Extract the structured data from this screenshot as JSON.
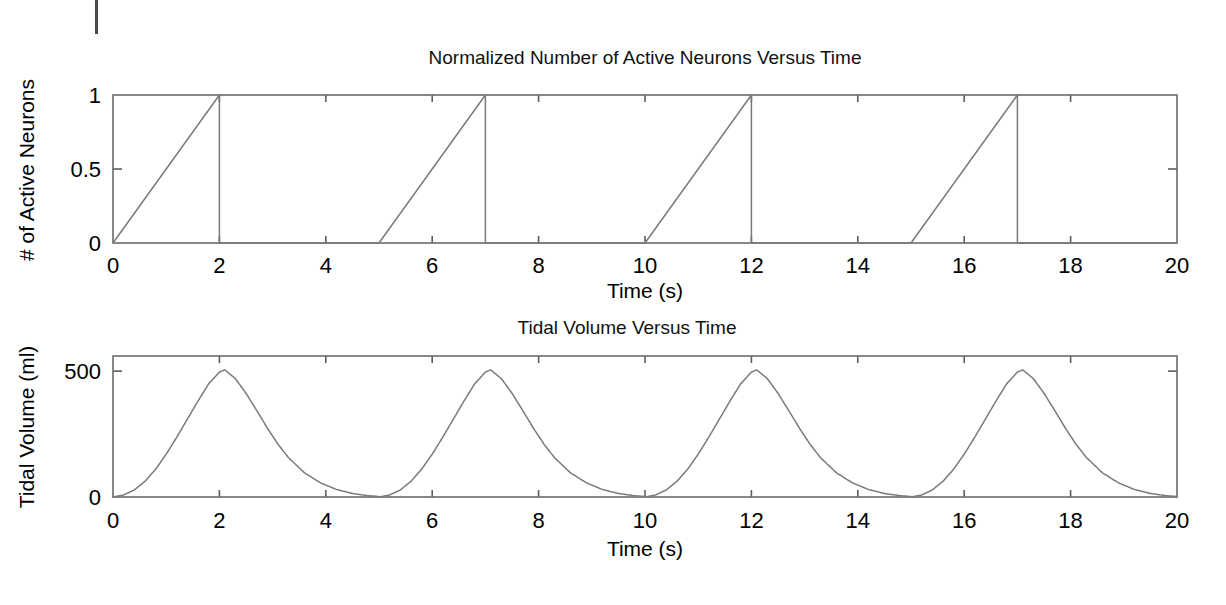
{
  "figure": {
    "background_color": "#ffffff",
    "line_color": "#7a7a7a",
    "axis_color": "#6b6b6b",
    "text_color": "#000000",
    "width": 1226,
    "height": 605
  },
  "artifact": {
    "name": "scan-edge-mark",
    "x": 95,
    "y": 0,
    "width": 3,
    "height": 34
  },
  "chart_data": [
    {
      "id": "neurons",
      "type": "line",
      "title": "Normalized Number of Active Neurons Versus Time",
      "xlabel": "Time (s)",
      "ylabel": "# of Active Neurons",
      "xlim": [
        0,
        20
      ],
      "ylim": [
        0,
        1
      ],
      "xticks": [
        0,
        2,
        4,
        6,
        8,
        10,
        12,
        14,
        16,
        18,
        20
      ],
      "xticklabels": [
        "0",
        "2",
        "4",
        "6",
        "8",
        "10",
        "12",
        "14",
        "16",
        "18",
        "20"
      ],
      "yticks": [
        0,
        0.5,
        1
      ],
      "yticklabels": [
        "0",
        "0.5",
        "1"
      ],
      "grid": false,
      "legend": null,
      "description": "Sawtooth ramp: rises linearly 0 to 1 during each 2 s inspiration, drops instantly to 0, stays at 0 until the next breath; breath period 5 s.",
      "waveform": {
        "kind": "sawtooth",
        "period": 5,
        "ramp_duration": 2,
        "peak": 1,
        "baseline": 0,
        "ramp_starts": [
          0,
          5,
          10,
          15
        ],
        "ramp_peaks": [
          2,
          7,
          12,
          17
        ]
      },
      "points": [
        [
          0,
          0
        ],
        [
          2,
          1
        ],
        [
          2,
          0
        ],
        [
          5,
          0
        ],
        [
          7,
          1
        ],
        [
          7,
          0
        ],
        [
          10,
          0
        ],
        [
          12,
          1
        ],
        [
          12,
          0
        ],
        [
          15,
          0
        ],
        [
          17,
          1
        ],
        [
          17,
          0
        ],
        [
          20,
          0
        ]
      ]
    },
    {
      "id": "tidal_volume",
      "type": "line",
      "title": "Tidal Volume Versus Time",
      "xlabel": "Time (s)",
      "ylabel": "Tidal Volume (ml)",
      "xlim": [
        0,
        20
      ],
      "ylim": [
        0,
        560
      ],
      "xticks": [
        0,
        2,
        4,
        6,
        8,
        10,
        12,
        14,
        16,
        18,
        20
      ],
      "xticklabels": [
        "0",
        "2",
        "4",
        "6",
        "8",
        "10",
        "12",
        "14",
        "16",
        "18",
        "20"
      ],
      "yticks": [
        0,
        500
      ],
      "yticklabels": [
        "0",
        "500"
      ],
      "grid": false,
      "legend": null,
      "description": "Four breaths. Volume rises from 0 to about 500 ml peak at t = 2.1, 7.1, 12.1, 17.1 s, then decays exponentially back to near 0 ml before the next breath; breath period 5 s.",
      "waveform": {
        "kind": "breath",
        "period": 5,
        "peak_value": 505,
        "peak_times": [
          2.1,
          7.1,
          12.1,
          17.1
        ],
        "baseline": 0,
        "inspiration_duration": 2.1,
        "expiration_tau": 0.75
      },
      "series": [
        {
          "name": "Tidal Volume",
          "x": [
            0.0,
            0.2,
            0.4,
            0.6,
            0.8,
            1.0,
            1.2,
            1.4,
            1.6,
            1.8,
            2.0,
            2.1,
            2.3,
            2.5,
            2.7,
            2.9,
            3.1,
            3.3,
            3.6,
            3.9,
            4.2,
            4.5,
            4.8,
            5.0
          ],
          "values": [
            0,
            8,
            28,
            62,
            110,
            170,
            238,
            310,
            382,
            450,
            496,
            505,
            470,
            412,
            344,
            274,
            210,
            156,
            96,
            56,
            30,
            14,
            5,
            2
          ]
        }
      ]
    }
  ]
}
